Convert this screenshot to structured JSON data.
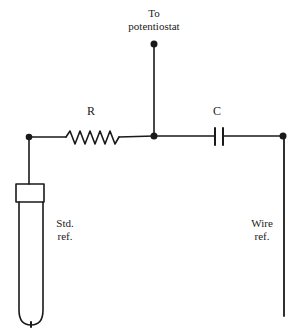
{
  "diagram": {
    "type": "circuit",
    "labels": {
      "potentiostat_line1": "To",
      "potentiostat_line2": "potentiostat",
      "resistor": "R",
      "capacitor": "C",
      "std_ref_line1": "Std.",
      "std_ref_line2": "ref.",
      "wire_ref_line1": "Wire",
      "wire_ref_line2": "ref."
    },
    "components": [
      {
        "id": "R",
        "kind": "resistor",
        "label": "R"
      },
      {
        "id": "C",
        "kind": "capacitor",
        "label": "C"
      },
      {
        "id": "std_ref",
        "kind": "standard reference electrode",
        "label": "Std. ref."
      },
      {
        "id": "wire_ref",
        "kind": "wire reference electrode",
        "label": "Wire ref."
      },
      {
        "id": "potentiostat",
        "kind": "terminal",
        "label": "To potentiostat"
      }
    ],
    "connections": [
      [
        "std_ref",
        "R"
      ],
      [
        "R",
        "junction"
      ],
      [
        "junction",
        "potentiostat"
      ],
      [
        "junction",
        "C"
      ],
      [
        "C",
        "wire_ref"
      ]
    ],
    "colors": {
      "line": "#1a1a1a",
      "background": "#ffffff"
    }
  }
}
